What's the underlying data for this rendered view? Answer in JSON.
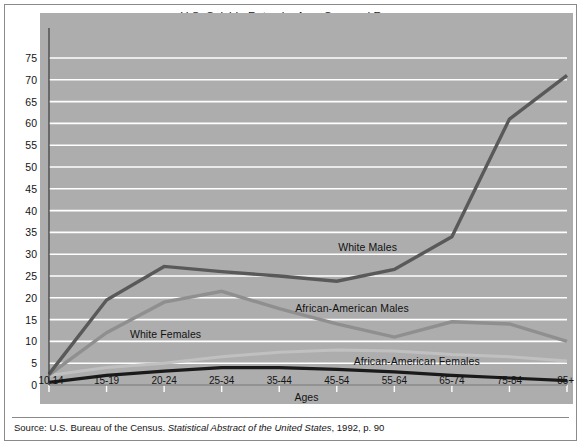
{
  "figure": {
    "title_line1": "U.S. Suicide Rates by Age, Sex, and Race",
    "title_line2": "(Rate per 100,000 persons of same sex, race, and age)",
    "source_prefix": "Source: U.S. Bureau of the Census. ",
    "source_italic": "Statistical Abstract of the United States",
    "source_suffix": ", 1992, p. 90",
    "background_color": "#adadad",
    "gridline_color": "#ffffff",
    "page_color": "#ffffff"
  },
  "chart_data": {
    "type": "line",
    "title": "U.S. Suicide Rates by Age, Sex, and Race (Rate per 100,000 persons of same sex, race, and age)",
    "xlabel": "Ages",
    "ylabel": "",
    "ylim": [
      0,
      75
    ],
    "ytick_step": 5,
    "yticks": [
      0,
      5,
      10,
      15,
      20,
      25,
      30,
      35,
      40,
      45,
      50,
      55,
      60,
      65,
      70,
      75
    ],
    "grid": true,
    "legend_position": "inline-labels",
    "categories": [
      "10-14",
      "15-19",
      "20-24",
      "25-34",
      "35-44",
      "45-54",
      "55-64",
      "65-74",
      "75-84",
      "85+"
    ],
    "series": [
      {
        "name": "White Males",
        "color": "#595959",
        "stroke_width": 3.4,
        "values": [
          2.5,
          19.5,
          27.2,
          26.0,
          25.0,
          23.8,
          26.5,
          34.0,
          61.0,
          71.0
        ]
      },
      {
        "name": "African-American Males",
        "color": "#8f8f8f",
        "stroke_width": 3.4,
        "values": [
          2.3,
          12.0,
          19.0,
          21.5,
          17.5,
          14.0,
          11.0,
          14.5,
          14.0,
          10.0
        ]
      },
      {
        "name": "White Females",
        "color": "#c0c0c0",
        "stroke_width": 3.0,
        "values": [
          2.2,
          4.0,
          5.0,
          6.5,
          7.5,
          8.0,
          7.8,
          7.0,
          6.5,
          5.5
        ]
      },
      {
        "name": "African-American Females",
        "color": "#1a1a1a",
        "stroke_width": 3.2,
        "values": [
          0.6,
          2.2,
          3.2,
          4.0,
          4.0,
          3.6,
          3.0,
          2.2,
          1.6,
          1.0
        ]
      }
    ],
    "annotations": [
      {
        "text": "White Males",
        "x_pct": 61.5,
        "y_value": 31.5
      },
      {
        "text": "African-American Males",
        "x_pct": 58.5,
        "y_value": 17.5
      },
      {
        "text": "White Females",
        "x_pct": 22.5,
        "y_value": 11.5
      },
      {
        "text": "African-American Females",
        "x_pct": 71.0,
        "y_value": 5.3
      }
    ]
  }
}
